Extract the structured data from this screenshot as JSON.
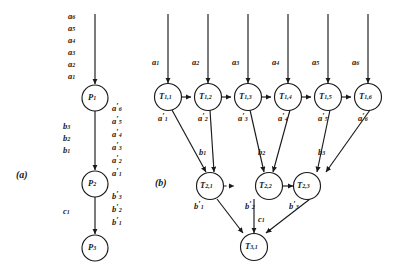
{
  "figure": {
    "type": "diagram",
    "panels": [
      {
        "key": "a",
        "label": "(a)"
      },
      {
        "key": "b",
        "label": "(b)"
      }
    ]
  },
  "panel_a": {
    "label": "(a)",
    "nodes": [
      {
        "id": "P1",
        "label": "P",
        "sub": "1"
      },
      {
        "id": "P2",
        "label": "P",
        "sub": "2"
      },
      {
        "id": "P3",
        "label": "P",
        "sub": "3"
      }
    ],
    "input_stack": [
      {
        "base": "a",
        "sub": "6",
        "prime": false
      },
      {
        "base": "a",
        "sub": "5",
        "prime": false
      },
      {
        "base": "a",
        "sub": "4",
        "prime": false
      },
      {
        "base": "a",
        "sub": "3",
        "prime": false
      },
      {
        "base": "a",
        "sub": "2",
        "prime": false
      },
      {
        "base": "a",
        "sub": "1",
        "prime": false
      }
    ],
    "edge_p1_p2_left": [
      {
        "base": "b",
        "sub": "3",
        "prime": false
      },
      {
        "base": "b",
        "sub": "2",
        "prime": false
      },
      {
        "base": "b",
        "sub": "1",
        "prime": false
      }
    ],
    "edge_p1_p2_right": [
      {
        "base": "a",
        "sub": "6",
        "prime": true
      },
      {
        "base": "a",
        "sub": "5",
        "prime": true
      },
      {
        "base": "a",
        "sub": "4",
        "prime": true
      },
      {
        "base": "a",
        "sub": "3",
        "prime": true
      },
      {
        "base": "a",
        "sub": "2",
        "prime": true
      },
      {
        "base": "a",
        "sub": "1",
        "prime": true
      }
    ],
    "edge_p2_p3_left": [
      {
        "base": "c",
        "sub": "1",
        "prime": false
      }
    ],
    "edge_p2_p3_right": [
      {
        "base": "b",
        "sub": "3",
        "prime": true
      },
      {
        "base": "b",
        "sub": "2",
        "prime": true
      },
      {
        "base": "b",
        "sub": "1",
        "prime": true
      }
    ]
  },
  "panel_b": {
    "label": "(b)",
    "row1": [
      {
        "id": "T11",
        "label": "T",
        "sub": "1,1",
        "input": {
          "base": "a",
          "sub": "1",
          "prime": false
        },
        "output": {
          "base": "a",
          "sub": "1",
          "prime": true
        }
      },
      {
        "id": "T12",
        "label": "T",
        "sub": "1,2",
        "input": {
          "base": "a",
          "sub": "2",
          "prime": false
        },
        "output": {
          "base": "a",
          "sub": "2",
          "prime": true
        }
      },
      {
        "id": "T13",
        "label": "T",
        "sub": "1,3",
        "input": {
          "base": "a",
          "sub": "3",
          "prime": false
        },
        "output": {
          "base": "a",
          "sub": "3",
          "prime": true
        }
      },
      {
        "id": "T14",
        "label": "T",
        "sub": "1,4",
        "input": {
          "base": "a",
          "sub": "4",
          "prime": false
        },
        "output": {
          "base": "a",
          "sub": "4",
          "prime": true
        }
      },
      {
        "id": "T15",
        "label": "T",
        "sub": "1,5",
        "input": {
          "base": "a",
          "sub": "5",
          "prime": false
        },
        "output": {
          "base": "a",
          "sub": "5",
          "prime": true
        }
      },
      {
        "id": "T16",
        "label": "T",
        "sub": "1,6",
        "input": {
          "base": "a",
          "sub": "6",
          "prime": false
        },
        "output": {
          "base": "a",
          "sub": "6",
          "prime": true
        }
      }
    ],
    "row2": [
      {
        "id": "T21",
        "label": "T",
        "sub": "2,1",
        "input": {
          "base": "b",
          "sub": "1",
          "prime": false
        },
        "output": {
          "base": "b",
          "sub": "1",
          "prime": true
        }
      },
      {
        "id": "T22",
        "label": "T",
        "sub": "2,2",
        "input": {
          "base": "b",
          "sub": "2",
          "prime": false
        },
        "output": {
          "base": "b",
          "sub": "2",
          "prime": true
        }
      },
      {
        "id": "T23",
        "label": "T",
        "sub": "2,3",
        "input": {
          "base": "b",
          "sub": "3",
          "prime": false
        },
        "output": {
          "base": "b",
          "sub": "3",
          "prime": true
        }
      }
    ],
    "row3": [
      {
        "id": "T31",
        "label": "T",
        "sub": "3,1"
      }
    ],
    "sink_label": {
      "base": "c",
      "sub": "1",
      "prime": false
    },
    "dashed_edge": {
      "from": "T21",
      "to": "T22"
    }
  },
  "style": {
    "stroke": "#1a1a1a",
    "fill": "#ffffff",
    "background": "#ffffff"
  }
}
